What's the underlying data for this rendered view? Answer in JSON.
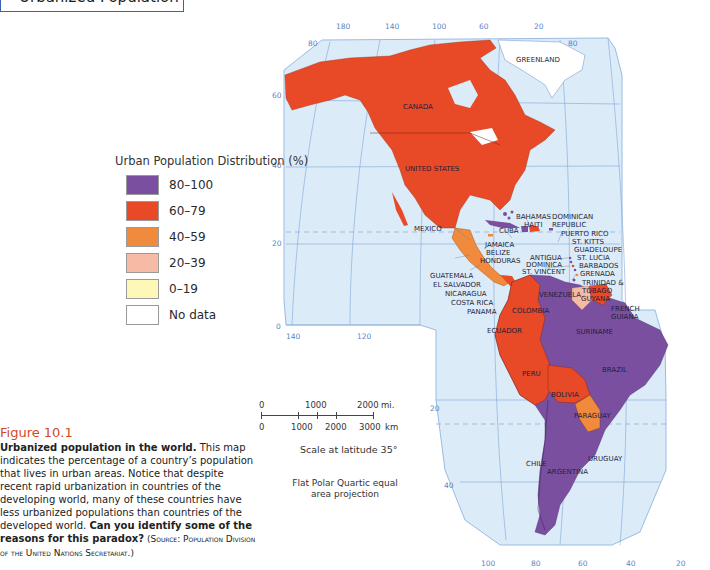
{
  "header": {
    "title": "Urbanized Population"
  },
  "legend": {
    "title": "Urban Population Distribution (%)",
    "items": [
      {
        "label": "80–100",
        "color": "#7a4fa0"
      },
      {
        "label": "60–79",
        "color": "#e84a27"
      },
      {
        "label": "40–59",
        "color": "#f08a3c"
      },
      {
        "label": "20–39",
        "color": "#f5bba4"
      },
      {
        "label": "0–19",
        "color": "#fdf8b8"
      },
      {
        "label": "No data",
        "color": "#ffffff"
      }
    ]
  },
  "scale": {
    "miles_ticks": [
      "0",
      "1000",
      "2000"
    ],
    "miles_unit": "mi.",
    "km_ticks": [
      "0",
      "1000",
      "2000",
      "3000"
    ],
    "km_unit": "km",
    "note": "Scale at latitude 35°",
    "projection": "Flat Polar Quartic equal area projection"
  },
  "caption": {
    "figure": "Figure 10.1",
    "bold_lead": "Urbanized population in the world.",
    "body": " This map indicates the percentage of a country’s population that lives in urban areas. Notice that despite recent rapid urbanization in countries of the developing world, many of these countries have less urbanized populations than countries of the developed world. ",
    "bold_question": "Can you identify some of the reasons for this paradox?",
    "source": " (Source: Population Division of the United Nations Secretariat.)"
  },
  "map": {
    "colors": {
      "ocean": "#dcebf8",
      "grid": "#7fa6d9",
      "frame": "#9bbbe3",
      "degree_text": "#5a86c7"
    },
    "top_longitudes": [
      "180",
      "140",
      "100",
      "60",
      "20"
    ],
    "bottom_longitudes": [
      "100",
      "80",
      "60",
      "40",
      "20"
    ],
    "left_latitudes": [
      "80",
      "60",
      "40",
      "20",
      "0"
    ],
    "right_latitudes": [
      "80"
    ],
    "mid_longitudes": [
      "140",
      "120"
    ],
    "south_latitudes": [
      "20",
      "40"
    ],
    "country_labels": {
      "greenland": "GREENLAND",
      "canada": "CANADA",
      "united_states": "UNITED STATES",
      "mexico": "MEXICO",
      "bahamas": "BAHAMAS",
      "haiti": "HAITI",
      "dominican_republic_1": "DOMINICAN",
      "dominican_republic_2": "REPUBLIC",
      "puerto_rico": "PUERTO RICO",
      "st_kitts": "ST. KITTS",
      "guadeloupe": "GUADELOUPE",
      "st_lucia": "ST. LUCIA",
      "barbados": "BARBADOS",
      "grenada": "GRENADA",
      "trinidad_1": "TRINIDAD &",
      "trinidad_2": "TOBAGO",
      "cuba": "CUBA",
      "jamaica": "JAMAICA",
      "belize": "BELIZE",
      "honduras": "HONDURAS",
      "antigua": "ANTIGUA",
      "dominica": "DOMINICA",
      "st_vincent": "ST. VINCENT",
      "guatemala": "GUATEMALA",
      "el_salvador": "EL SALVADOR",
      "nicaragua": "NICARAGUA",
      "costa_rica": "COSTA RICA",
      "panama": "PANAMA",
      "venezuela": "VENEZUELA",
      "guyana": "GUYANA",
      "french_guiana_1": "FRENCH",
      "french_guiana_2": "GUIANA",
      "suriname": "SURINAME",
      "colombia": "COLOMBIA",
      "ecuador": "ECUADOR",
      "brazil": "BRAZIL",
      "peru": "PERU",
      "bolivia": "BOLIVIA",
      "paraguay": "PARAGUAY",
      "chile": "CHILE",
      "argentina": "ARGENTINA",
      "uruguay": "URUGUAY"
    }
  }
}
